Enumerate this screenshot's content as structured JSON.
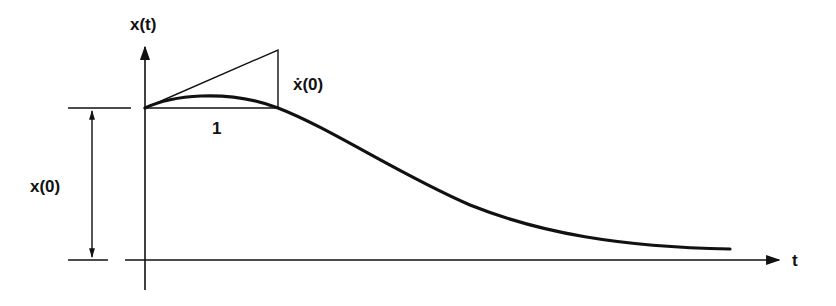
{
  "diagram": {
    "type": "response-curve",
    "colors": {
      "ink": "#111111",
      "background": "#ffffff"
    },
    "labels": {
      "y_axis": "x(t)",
      "x_axis": "t",
      "initial_value": "x(0)",
      "initial_slope": "ẋ(0)",
      "unit_interval": "1"
    },
    "axes": {
      "origin": [
        145,
        260
      ],
      "y_axis": {
        "x": 145,
        "y_top": 45,
        "y_bottom": 290
      },
      "x_axis": {
        "y": 260,
        "x_left": 125,
        "x_right": 780
      }
    },
    "initial_level_y": 108,
    "tangent_triangle": [
      [
        145,
        108
      ],
      [
        278,
        50
      ],
      [
        278,
        108
      ]
    ],
    "curve_points": [
      [
        145,
        108
      ],
      [
        178,
        99
      ],
      [
        210,
        96
      ],
      [
        245,
        99
      ],
      [
        278,
        108
      ],
      [
        330,
        132
      ],
      [
        400,
        170
      ],
      [
        470,
        204
      ],
      [
        540,
        228
      ],
      [
        610,
        242
      ],
      [
        670,
        247
      ],
      [
        730,
        249
      ]
    ],
    "dimension_arrow": {
      "x": 92,
      "y_top": 108,
      "y_bottom": 260
    }
  }
}
